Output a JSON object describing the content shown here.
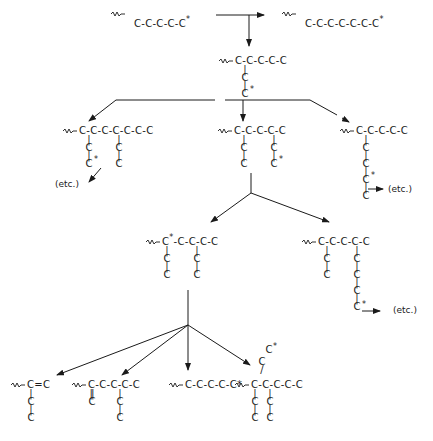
{
  "diagram": {
    "title": "",
    "colors": {
      "ink": "#1a1a1a",
      "background": "#ffffff"
    },
    "symbols": {
      "wavy_bond": "wavy-line",
      "radical_marker": "*",
      "single_bond": "-",
      "double_bond": "="
    },
    "level0": {
      "start": {
        "chain": "C-C-C-C-C",
        "radical": "*",
        "label": "~C-C-C-C-C*"
      },
      "propagation_product": {
        "chain": "C-C-C-C-C-C-C",
        "radical": "*",
        "label": "~C-C-C-C-C-C-C*"
      }
    },
    "level1": {
      "main": "~C-C-C-C-C",
      "branch": [
        "C",
        "C"
      ],
      "branch_radical": "*"
    },
    "level2": {
      "left": {
        "main": "~C-C-C-C-C-C-C",
        "branches": [
          [
            "C",
            "C*"
          ],
          [
            "C",
            "C"
          ]
        ],
        "etc": "(etc.)"
      },
      "middle": {
        "main": "~C-C-C-C-C",
        "branches": [
          [
            "C",
            "C"
          ],
          [
            "C",
            "C*"
          ]
        ]
      },
      "right": {
        "main": "~C-C-C-C-C",
        "branch": [
          "C",
          "C",
          "C",
          "C*"
        ],
        "etc": "(etc.)"
      }
    },
    "level3": {
      "left": {
        "main": "~C*-C-C-C-C",
        "branches": [
          [
            "C",
            "C"
          ],
          [
            "C",
            "C"
          ]
        ]
      },
      "right": {
        "main": "~C-C-C-C-C",
        "branches": [
          [
            "C",
            "C"
          ],
          [
            "C",
            "C",
            "C",
            "C*"
          ]
        ],
        "etc": "(etc.)"
      }
    },
    "level4": {
      "p1": {
        "main": "~C=C",
        "branch": [
          "C",
          "C"
        ]
      },
      "p2": {
        "main": "~C-C-C-C-C",
        "double_bond_branch": "C",
        "branch": [
          "C",
          "C"
        ]
      },
      "p3": {
        "main": "~C-C-C-C-C*"
      },
      "p4": {
        "main": "~C-C-C-C-C",
        "up_branch": [
          "C",
          "C*"
        ],
        "branches": [
          [
            "C",
            "C"
          ],
          [
            "C",
            "C"
          ]
        ]
      }
    },
    "strings": {
      "C": "C",
      "dash": "-",
      "bar": "|",
      "eq": "=",
      "dbar": "‖",
      "star": "*",
      "etc": "(etc.)",
      "faint_bottom": "— cut-off caption text —"
    }
  }
}
